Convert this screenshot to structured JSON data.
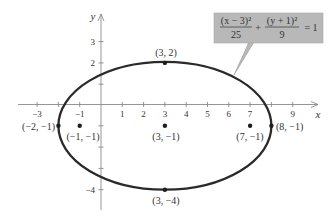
{
  "equation": {
    "term1_num": "(x − 3)²",
    "term1_den": "25",
    "plus": "+",
    "term2_num": "(y + 1)²",
    "term2_den": "9",
    "rhs": "= 1",
    "box_color": "#b8b8b8"
  },
  "axes": {
    "x_name": "x",
    "y_name": "y",
    "x_ticks": [
      "−3",
      "−1",
      "1",
      "2",
      "3",
      "4",
      "5",
      "6",
      "7",
      "9"
    ],
    "y_ticks": [
      "3",
      "2",
      "−4"
    ]
  },
  "points": {
    "top": "(3, 2)",
    "left_vertex": "(−2, −1)",
    "left_focus": "(−1, −1)",
    "center": "(3, −1)",
    "right_focus": "(7, −1)",
    "right_vertex": "(8, −1)",
    "bottom": "(3, −4)"
  },
  "colors": {
    "curve": "#2a2a2a",
    "axis": "#888888",
    "text": "#333333"
  }
}
